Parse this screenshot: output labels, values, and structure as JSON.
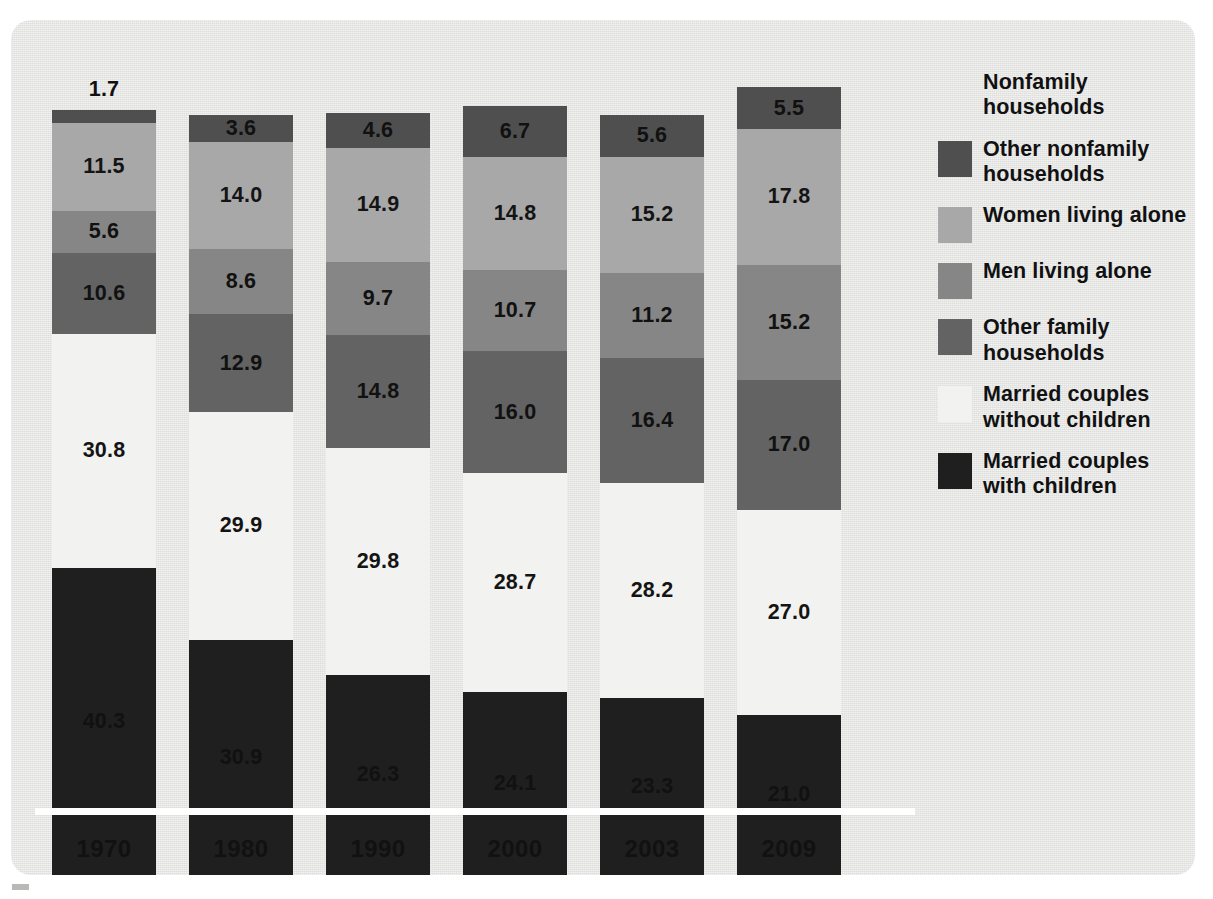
{
  "colors": {
    "panel_background": "#e6e6e4",
    "baseline_rule": "#ffffff",
    "other_nonfamily_households": "#4f4f4f",
    "women_living_alone": "#a8a8a8",
    "men_living_alone": "#868686",
    "other_family_households": "#636363",
    "married_couples_without_children": "#f2f2f0",
    "married_couples_with_children": "#1f1f1f",
    "label_text": "#111111"
  },
  "legend": {
    "items": [
      {
        "label": "Nonfamily households",
        "swatch": "none",
        "has_swatch": false
      },
      {
        "label": "Other nonfamily households",
        "swatch": "#4f4f4f",
        "has_swatch": true
      },
      {
        "label": "Women living alone",
        "swatch": "#a8a8a8",
        "has_swatch": true
      },
      {
        "label": "Men living alone",
        "swatch": "#868686",
        "has_swatch": true
      },
      {
        "label": "Other family households",
        "swatch": "#636363",
        "has_swatch": true
      },
      {
        "label": "Married couples without children",
        "swatch": "#f2f2f0",
        "has_swatch": true
      },
      {
        "label": "Married couples with children",
        "swatch": "#1f1f1f",
        "has_swatch": true
      }
    ]
  },
  "chart_data": {
    "type": "bar",
    "subtype": "stacked-bar-100-percent",
    "title": "",
    "subtitle": "",
    "xlabel": "",
    "ylabel": "",
    "ylim": [
      0,
      100
    ],
    "grid": false,
    "legend_position": "right",
    "categories": [
      "1970",
      "1980",
      "1990",
      "2000",
      "2003",
      "2009"
    ],
    "stack_order_bottom_to_top": [
      "Married couples with children",
      "Married couples without children",
      "Other family households",
      "Men living alone",
      "Women living alone",
      "Other nonfamily households"
    ],
    "series": [
      {
        "name": "Married couples with children",
        "color": "#1f1f1f",
        "values": [
          40.3,
          30.9,
          26.3,
          24.1,
          23.3,
          21.0
        ],
        "labels": [
          "40.3",
          "30.9",
          "26.3",
          "24.1",
          "23.3",
          "21.0"
        ]
      },
      {
        "name": "Married couples without children",
        "color": "#f2f2f0",
        "values": [
          30.8,
          29.9,
          29.8,
          28.7,
          28.2,
          27.0
        ],
        "labels": [
          "30.8",
          "29.9",
          "29.8",
          "28.7",
          "28.2",
          "27.0"
        ]
      },
      {
        "name": "Other family households",
        "color": "#636363",
        "values": [
          10.6,
          12.9,
          14.8,
          16.0,
          16.4,
          17.0
        ],
        "labels": [
          "10.6",
          "12.9",
          "14.8",
          "16.0",
          "16.4",
          "17.0"
        ]
      },
      {
        "name": "Men living alone",
        "color": "#868686",
        "values": [
          5.6,
          8.6,
          9.7,
          10.7,
          11.2,
          15.2
        ],
        "labels": [
          "5.6",
          "8.6",
          "9.7",
          "10.7",
          "11.2",
          "15.2"
        ]
      },
      {
        "name": "Women living alone",
        "color": "#a8a8a8",
        "values": [
          11.5,
          14.0,
          14.9,
          14.8,
          15.2,
          17.8
        ],
        "labels": [
          "11.5",
          "14.0",
          "14.9",
          "14.8",
          "15.2",
          "17.8"
        ]
      },
      {
        "name": "Other nonfamily households",
        "color": "#4f4f4f",
        "values": [
          1.7,
          3.6,
          4.6,
          6.7,
          5.6,
          5.5
        ],
        "labels": [
          "1.7",
          "3.6",
          "4.6",
          "6.7",
          "5.6",
          "5.5"
        ]
      }
    ]
  }
}
